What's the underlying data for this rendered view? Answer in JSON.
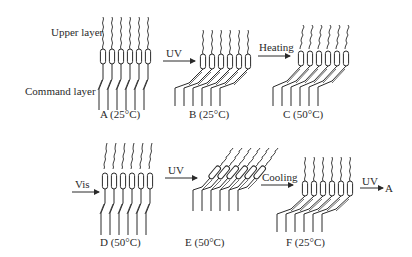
{
  "labels": {
    "upper_layer": "Upper layer",
    "command_layer": "Command layer"
  },
  "states": [
    {
      "id": "A",
      "caption": "A (25°C)"
    },
    {
      "id": "B",
      "caption": "B (25°C)"
    },
    {
      "id": "C",
      "caption": "C (50°C)"
    },
    {
      "id": "D",
      "caption": "D (50°C)"
    },
    {
      "id": "E",
      "caption": "E (50°C)"
    },
    {
      "id": "F",
      "caption": "F (25°C)"
    }
  ],
  "transitions": [
    {
      "from": "A",
      "to": "B",
      "label": "UV"
    },
    {
      "from": "B",
      "to": "C",
      "label": "Heating"
    },
    {
      "from": "C",
      "to": "D",
      "label": "Vis"
    },
    {
      "from": "D",
      "to": "E",
      "label": "UV"
    },
    {
      "from": "E",
      "to": "F",
      "label": "Cooling"
    },
    {
      "from": "F",
      "to": "A",
      "label": "UV",
      "target_label": "A"
    }
  ],
  "colors": {
    "ink": "#2a2a2a",
    "background": "#ffffff"
  }
}
